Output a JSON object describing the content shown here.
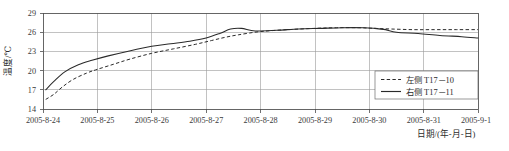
{
  "chart_data": {
    "type": "line",
    "title": "",
    "xlabel": "日期/(年-月-日)",
    "ylabel": "温度/℃",
    "grid": true,
    "legend_position": "bottom-right",
    "x_categories": [
      "2005-8-24",
      "2005-8-25",
      "2005-8-26",
      "2005-8-27",
      "2005-8-28",
      "2005-8-29",
      "2005-8-30",
      "2005-8-31",
      "2005-9-1"
    ],
    "y_ticks": [
      14,
      17,
      20,
      23,
      26,
      29
    ],
    "ylim": [
      14,
      29
    ],
    "xlim": [
      "2005-8-24",
      "2005-9-1"
    ],
    "series": [
      {
        "name": "左侧 T17-10",
        "style": "dashed",
        "color": "#2a2a2a",
        "x": [
          "2005-8-24.05",
          "2005-8-24.20",
          "2005-8-24.35",
          "2005-8-24.55",
          "2005-8-24.80",
          "2005-8-25.00",
          "2005-8-25.30",
          "2005-8-25.60",
          "2005-8-26.00",
          "2005-8-26.40",
          "2005-8-26.80",
          "2005-8-27.10",
          "2005-8-27.35",
          "2005-8-27.60",
          "2005-8-28.00",
          "2005-8-28.50",
          "2005-8-29.00",
          "2005-8-29.40",
          "2005-8-29.80",
          "2005-8-30.10",
          "2005-8-30.40",
          "2005-8-30.80",
          "2005-8-31.20",
          "2005-8-31.60",
          "2005-9-1.00"
        ],
        "values": [
          15.5,
          16.3,
          17.4,
          18.6,
          19.6,
          20.2,
          21.0,
          21.8,
          22.7,
          23.4,
          24.1,
          24.7,
          25.2,
          25.6,
          26.1,
          26.4,
          26.6,
          26.7,
          26.7,
          26.6,
          26.5,
          26.4,
          26.4,
          26.4,
          26.4
        ]
      },
      {
        "name": "右侧 T17-11",
        "style": "solid",
        "color": "#2a2a2a",
        "x": [
          "2005-8-24.05",
          "2005-8-24.20",
          "2005-8-24.40",
          "2005-8-24.65",
          "2005-8-24.90",
          "2005-8-25.20",
          "2005-8-25.55",
          "2005-8-26.00",
          "2005-8-26.35",
          "2005-8-26.70",
          "2005-8-27.00",
          "2005-8-27.25",
          "2005-8-27.45",
          "2005-8-27.65",
          "2005-8-27.90",
          "2005-8-28.30",
          "2005-8-28.70",
          "2005-8-29.10",
          "2005-8-29.50",
          "2005-8-29.90",
          "2005-8-30.10",
          "2005-8-30.30",
          "2005-8-30.50",
          "2005-8-30.90",
          "2005-8-31.30",
          "2005-8-31.70",
          "2005-9-1.00"
        ],
        "values": [
          17.0,
          18.3,
          19.8,
          20.9,
          21.6,
          22.3,
          23.0,
          23.8,
          24.2,
          24.6,
          25.1,
          25.8,
          26.5,
          26.6,
          26.2,
          26.3,
          26.5,
          26.6,
          26.7,
          26.7,
          26.6,
          26.4,
          26.0,
          25.8,
          25.5,
          25.3,
          25.1
        ]
      }
    ]
  },
  "legend": {
    "entries": [
      {
        "label": "左侧 T17－10",
        "style": "dashed"
      },
      {
        "label": "右侧 T17－11",
        "style": "solid"
      }
    ]
  },
  "axes": {
    "y_title": "温度/℃",
    "x_title": "日期/(年-月-日)",
    "y_tick_labels": [
      "29",
      "26",
      "23",
      "20",
      "17",
      "14"
    ],
    "x_tick_labels": [
      "2005-8-24",
      "2005-8-25",
      "2005-8-26",
      "2005-8-27",
      "2005-8-28",
      "2005-8-29",
      "2005-8-30",
      "2005-8-31",
      "2005-9-1"
    ]
  }
}
